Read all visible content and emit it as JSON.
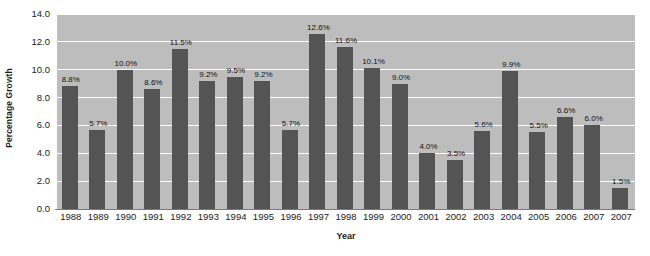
{
  "chart_data": {
    "type": "bar",
    "title": "",
    "xlabel": "Year",
    "ylabel": "Percentage Growth",
    "ylim": [
      0.0,
      14.0
    ],
    "ytick_step": 2.0,
    "grid": true,
    "legend": "none",
    "yticks": [
      "0.0",
      "2.0",
      "4.0",
      "6.0",
      "8.0",
      "10.0",
      "12.0",
      "14.0"
    ],
    "categories": [
      "1988",
      "1989",
      "1990",
      "1991",
      "1992",
      "1993",
      "1994",
      "1995",
      "1996",
      "1997",
      "1998",
      "1999",
      "2000",
      "2001",
      "2002",
      "2003",
      "2004",
      "2005",
      "2006",
      "2007",
      "2007"
    ],
    "values": [
      8.8,
      5.7,
      10.0,
      8.6,
      11.5,
      9.2,
      9.5,
      9.2,
      5.7,
      12.6,
      11.6,
      10.1,
      9.0,
      4.0,
      3.5,
      5.6,
      9.9,
      5.5,
      6.6,
      6.0,
      1.5
    ],
    "value_labels": [
      "8.8%",
      "5.7%",
      "10.0%",
      "8.6%",
      "11.5%",
      "9.2%",
      "9.5%",
      "9.2%",
      "5.7%",
      "12.6%",
      "11.6%",
      "10.1%",
      "9.0%",
      "4.0%",
      "3.5%",
      "5.6%",
      "9.9%",
      "5.5%",
      "6.6%",
      "6.0%",
      "1.5%"
    ],
    "colors": {
      "bar": "#545454",
      "plot_background": "#bdbdbd",
      "gridline": "#ffffff",
      "page_background": "#ffffff",
      "text": "#1a1a1a"
    }
  }
}
